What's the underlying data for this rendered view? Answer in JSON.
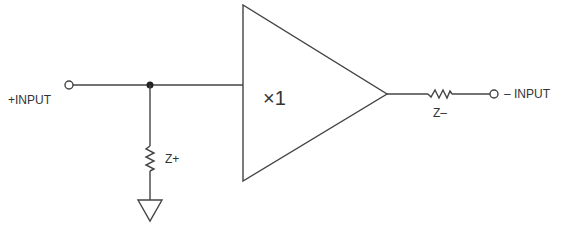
{
  "diagram": {
    "type": "circuit-schematic",
    "labels": {
      "plus_input": "+INPUT",
      "minus_input": "– INPUT",
      "buffer_gain": "×1",
      "z_plus": "Z+",
      "z_minus": "Z–"
    },
    "components": [
      {
        "id": "plus-input-terminal",
        "kind": "terminal"
      },
      {
        "id": "junction",
        "kind": "node"
      },
      {
        "id": "z-plus",
        "kind": "impedance",
        "connects": [
          "junction",
          "ground"
        ]
      },
      {
        "id": "ground",
        "kind": "ground"
      },
      {
        "id": "buffer",
        "kind": "amplifier",
        "gain": "x1"
      },
      {
        "id": "z-minus",
        "kind": "impedance",
        "connects": [
          "buffer-output",
          "minus-input-terminal"
        ]
      },
      {
        "id": "minus-input-terminal",
        "kind": "terminal"
      }
    ],
    "colors": {
      "stroke": "#444444",
      "text": "#333333",
      "background": "#ffffff"
    }
  }
}
